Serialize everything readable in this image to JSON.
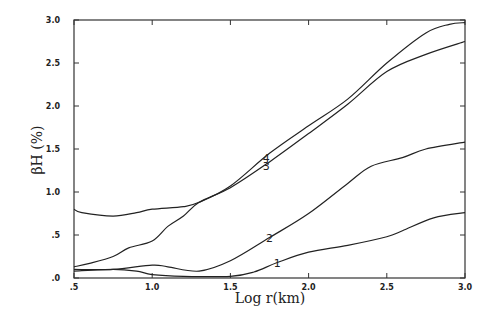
{
  "chart_data": {
    "type": "line",
    "title": "",
    "xlabel": "Log r(km)",
    "ylabel": "βH (%)",
    "xlim": [
      0.5,
      3.0
    ],
    "ylim": [
      0.0,
      3.0
    ],
    "xticks": [
      0.5,
      1.0,
      1.5,
      2.0,
      2.5,
      3.0
    ],
    "xtick_labels": [
      ".5",
      "1.0",
      "1.5",
      "2.0",
      "2.5",
      "3.0"
    ],
    "yticks": [
      0.0,
      0.5,
      1.0,
      1.5,
      2.0,
      2.5,
      3.0
    ],
    "ytick_labels": [
      ".0",
      ".5",
      "1.0",
      "1.5",
      "2.0",
      "2.5",
      "3.0"
    ],
    "grid": false,
    "legend": "inline curve labels",
    "series": [
      {
        "name": "1",
        "label_at": [
          1.8,
          0.17
        ],
        "x": [
          0.5,
          0.75,
          0.9,
          1.0,
          1.2,
          1.5,
          1.65,
          1.8,
          2.0,
          2.25,
          2.5,
          2.6,
          2.8,
          3.0
        ],
        "values": [
          0.08,
          0.1,
          0.08,
          0.04,
          0.02,
          0.02,
          0.07,
          0.18,
          0.3,
          0.38,
          0.48,
          0.55,
          0.7,
          0.76
        ]
      },
      {
        "name": "2",
        "label_at": [
          1.75,
          0.47
        ],
        "x": [
          0.5,
          0.75,
          1.0,
          1.1,
          1.3,
          1.5,
          1.75,
          2.0,
          2.25,
          2.4,
          2.6,
          2.75,
          3.0
        ],
        "values": [
          0.1,
          0.1,
          0.15,
          0.13,
          0.08,
          0.2,
          0.47,
          0.75,
          1.1,
          1.3,
          1.4,
          1.5,
          1.58
        ]
      },
      {
        "name": "3",
        "label_at": [
          1.73,
          1.3
        ],
        "x": [
          0.5,
          0.6,
          0.75,
          0.85,
          1.0,
          1.1,
          1.2,
          1.3,
          1.5,
          1.75,
          2.0,
          2.25,
          2.5,
          2.75,
          3.0
        ],
        "values": [
          0.13,
          0.17,
          0.25,
          0.35,
          0.43,
          0.6,
          0.72,
          0.88,
          1.05,
          1.35,
          1.68,
          2.02,
          2.4,
          2.6,
          2.75
        ]
      },
      {
        "name": "4",
        "label_at": [
          1.73,
          1.4
        ],
        "x": [
          0.5,
          0.55,
          0.75,
          0.9,
          1.0,
          1.2,
          1.3,
          1.5,
          1.75,
          2.0,
          2.25,
          2.5,
          2.75,
          2.9,
          3.0
        ],
        "values": [
          0.8,
          0.76,
          0.72,
          0.76,
          0.8,
          0.83,
          0.88,
          1.07,
          1.45,
          1.77,
          2.08,
          2.5,
          2.85,
          2.95,
          2.97
        ]
      }
    ]
  }
}
